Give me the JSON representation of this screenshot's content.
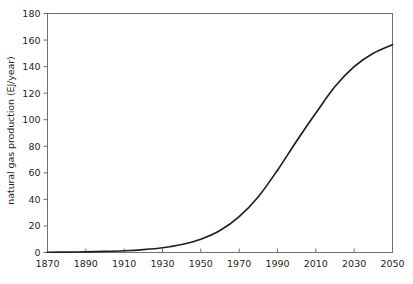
{
  "chart_data": {
    "type": "line",
    "title": "",
    "xlabel": "",
    "ylabel": "natural gas production (EJ/year)",
    "xlim": [
      1870,
      2050
    ],
    "ylim": [
      0,
      180
    ],
    "xticks": [
      1870,
      1890,
      1910,
      1930,
      1950,
      1970,
      1990,
      2010,
      2030,
      2050
    ],
    "yticks": [
      0,
      20,
      40,
      60,
      80,
      100,
      120,
      140,
      160,
      180
    ],
    "grid": false,
    "legend": null,
    "line_color": "#231f20",
    "axis_color": "#6f6f6f",
    "series": [
      {
        "name": "natural gas production",
        "x": [
          1870,
          1880,
          1890,
          1900,
          1910,
          1920,
          1930,
          1940,
          1950,
          1960,
          1970,
          1980,
          1990,
          2000,
          2010,
          2020,
          2030,
          2040,
          2050
        ],
        "values": [
          0.2,
          0.3,
          0.5,
          0.8,
          1.3,
          2.2,
          3.6,
          6.0,
          10.0,
          16.5,
          27.0,
          42.0,
          62.0,
          84.0,
          105.0,
          125.0,
          140.0,
          150.0,
          156.5
        ]
      }
    ]
  },
  "axis": {
    "ylabel_text": "natural gas production (EJ/year)",
    "ytick_labels": [
      "0",
      "20",
      "40",
      "60",
      "80",
      "100",
      "120",
      "140",
      "160",
      "180"
    ],
    "xtick_labels": [
      "1870",
      "1890",
      "1910",
      "1930",
      "1950",
      "1970",
      "1990",
      "2010",
      "2030",
      "2050"
    ]
  }
}
